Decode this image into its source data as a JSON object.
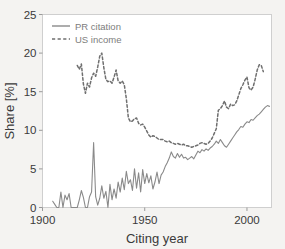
{
  "chart_data": {
    "type": "line",
    "title": "",
    "xlabel": "Citing year",
    "ylabel": "Share [%]",
    "xlim": [
      1900,
      2012
    ],
    "ylim": [
      0,
      25
    ],
    "xticks": [
      1900,
      1950,
      2000
    ],
    "xtick_labels": [
      "1900",
      "1950",
      "2000"
    ],
    "yticks": [
      0,
      5,
      10,
      15,
      20,
      25
    ],
    "ytick_labels": [
      "0",
      "5",
      "10",
      "15",
      "20",
      "25"
    ],
    "grid": false,
    "legend_position": "upper-left",
    "frame": true,
    "series": [
      {
        "name": "PR citation",
        "style": "solid",
        "color": "#8a8a8a",
        "x": [
          1905,
          1906,
          1907,
          1908,
          1909,
          1910,
          1911,
          1912,
          1913,
          1914,
          1915,
          1916,
          1917,
          1918,
          1919,
          1920,
          1921,
          1922,
          1923,
          1924,
          1925,
          1926,
          1927,
          1928,
          1929,
          1930,
          1931,
          1932,
          1933,
          1934,
          1935,
          1936,
          1937,
          1938,
          1939,
          1940,
          1941,
          1942,
          1943,
          1944,
          1945,
          1946,
          1947,
          1948,
          1949,
          1950,
          1951,
          1952,
          1953,
          1954,
          1955,
          1956,
          1957,
          1958,
          1959,
          1960,
          1961,
          1962,
          1963,
          1964,
          1965,
          1966,
          1967,
          1968,
          1969,
          1970,
          1971,
          1972,
          1973,
          1974,
          1975,
          1976,
          1977,
          1978,
          1979,
          1980,
          1981,
          1982,
          1983,
          1984,
          1985,
          1986,
          1987,
          1988,
          1989,
          1990,
          1991,
          1992,
          1993,
          1994,
          1995,
          1996,
          1997,
          1998,
          1999,
          2000,
          2001,
          2002,
          2003,
          2004,
          2005,
          2006,
          2007,
          2008,
          2009,
          2010,
          2011
        ],
        "values": [
          0.8,
          0.4,
          0.0,
          0.0,
          2.0,
          0.0,
          1.6,
          1.0,
          1.8,
          0.0,
          0.0,
          0.0,
          0.0,
          1.0,
          2.2,
          1.3,
          0.0,
          0.0,
          1.4,
          2.0,
          8.4,
          1.4,
          0.3,
          1.2,
          2.8,
          1.2,
          2.1,
          0.0,
          3.0,
          1.0,
          2.4,
          1.2,
          3.3,
          2.0,
          3.8,
          2.3,
          4.7,
          3.1,
          3.6,
          2.2,
          5.0,
          2.5,
          4.5,
          2.0,
          4.9,
          3.1,
          4.4,
          3.2,
          4.1,
          2.4,
          3.3,
          4.6,
          3.1,
          4.2,
          4.6,
          5.3,
          5.8,
          6.4,
          7.2,
          6.6,
          6.4,
          7.0,
          6.5,
          6.9,
          6.4,
          6.5,
          6.2,
          6.4,
          6.6,
          6.3,
          6.8,
          7.3,
          7.1,
          7.5,
          7.3,
          7.6,
          7.4,
          7.7,
          7.9,
          8.2,
          8.6,
          8.3,
          8.8,
          8.4,
          8.0,
          7.8,
          8.2,
          8.6,
          9.0,
          9.4,
          9.8,
          10.1,
          10.5,
          10.4,
          10.8,
          11.1,
          11.0,
          11.4,
          11.3,
          11.6,
          11.9,
          12.1,
          12.4,
          12.7,
          13.0,
          13.2,
          13.1
        ]
      },
      {
        "name": "US income",
        "style": "dashed",
        "color": "#6f6f6f",
        "x": [
          1917,
          1918,
          1919,
          1920,
          1921,
          1922,
          1923,
          1924,
          1925,
          1926,
          1927,
          1928,
          1929,
          1930,
          1931,
          1932,
          1933,
          1934,
          1935,
          1936,
          1937,
          1938,
          1939,
          1940,
          1941,
          1942,
          1943,
          1944,
          1945,
          1946,
          1947,
          1948,
          1949,
          1950,
          1951,
          1952,
          1953,
          1954,
          1955,
          1956,
          1957,
          1958,
          1959,
          1960,
          1961,
          1962,
          1963,
          1964,
          1965,
          1966,
          1967,
          1968,
          1969,
          1970,
          1971,
          1972,
          1973,
          1974,
          1975,
          1976,
          1977,
          1978,
          1979,
          1980,
          1981,
          1982,
          1983,
          1984,
          1985,
          1986,
          1987,
          1988,
          1989,
          1990,
          1991,
          1992,
          1993,
          1994,
          1995,
          1996,
          1997,
          1998,
          1999,
          2000,
          2001,
          2002,
          2003,
          2004,
          2005,
          2006,
          2007,
          2008
        ],
        "values": [
          18.4,
          17.9,
          18.6,
          16.0,
          14.8,
          16.1,
          15.6,
          16.8,
          17.4,
          17.0,
          18.2,
          19.6,
          20.0,
          18.1,
          16.6,
          16.3,
          16.4,
          16.1,
          16.9,
          17.8,
          16.4,
          16.1,
          16.4,
          15.9,
          14.1,
          11.6,
          11.1,
          11.2,
          11.5,
          11.6,
          10.9,
          10.7,
          10.8,
          10.4,
          9.9,
          9.4,
          9.1,
          9.3,
          9.2,
          9.0,
          8.8,
          8.8,
          8.8,
          8.6,
          8.5,
          8.6,
          8.4,
          8.3,
          8.2,
          8.3,
          8.2,
          8.1,
          8.2,
          8.0,
          8.0,
          7.9,
          7.8,
          7.9,
          8.0,
          8.1,
          8.3,
          8.4,
          8.3,
          8.2,
          8.3,
          8.6,
          9.0,
          9.6,
          10.2,
          12.6,
          12.8,
          13.2,
          13.8,
          13.0,
          12.8,
          13.4,
          13.2,
          13.3,
          13.8,
          14.6,
          15.4,
          15.9,
          16.5,
          16.9,
          15.5,
          15.2,
          15.6,
          16.6,
          17.8,
          18.5,
          18.4,
          17.6
        ]
      }
    ]
  },
  "legend": {
    "items": [
      {
        "label": "PR citation",
        "style": "solid"
      },
      {
        "label": "US income",
        "style": "dashed"
      }
    ]
  }
}
